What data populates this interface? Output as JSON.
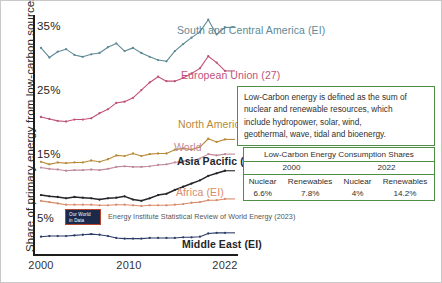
{
  "axes": {
    "ylabel": "Share of primary energy from low-carbon sources",
    "yticks": [
      "35%",
      "25%",
      "15%",
      "5%"
    ],
    "xticks": [
      "2000",
      "2010",
      "2022"
    ]
  },
  "series_labels": {
    "south_central_america": "South and Central America (EI)",
    "european_union": "European Union (27)",
    "north_america": "North America (EI)",
    "world": "World",
    "asia_pacific": "Asia Pacific (EI)",
    "africa": "Africa (EI)",
    "middle_east": "Middle East (EI)"
  },
  "note": {
    "line1": "Low-Carbon energy is defined as the sum of",
    "line2": "nuclear and renewable resources, which",
    "line3": "include hydropower, solar, wind,",
    "line4": "geothermal, wave, tidal and bioenergy."
  },
  "table": {
    "title": "Low-Carbon Energy Consumption Shares",
    "year_2000": "2000",
    "year_2022": "2022",
    "h_nuclear_2000": "Nuclear",
    "h_renew_2000": "Renewables",
    "h_nuclear_2022": "Nuclear",
    "h_renew_2022": "Renewables",
    "v_nuclear_2000": "6.6%",
    "v_renew_2000": "7.8%",
    "v_nuclear_2022": "4%",
    "v_renew_2022": "14.2%"
  },
  "footer": {
    "logo_line1": "Our World",
    "logo_line2": "in Data",
    "source": "Energy Institute Statistical Review of World Energy (2023)"
  },
  "colors": {
    "south_central_america": "#5d8a96",
    "european_union": "#c0527a",
    "north_america": "#b98a36",
    "world": "#c08a9a",
    "asia_pacific": "#25262a",
    "africa": "#d98a6a",
    "middle_east": "#2c3d68",
    "note_border": "#4f8f45",
    "axis": "#1d1d1d"
  },
  "chart_data": {
    "type": "line",
    "title": "",
    "xlabel": "",
    "ylabel": "Share of primary energy from low-carbon sources",
    "xlim": [
      2000,
      2022
    ],
    "ylim": [
      0,
      38
    ],
    "grid": false,
    "legend_position": "inline-right",
    "x": [
      2000,
      2001,
      2002,
      2003,
      2004,
      2005,
      2006,
      2007,
      2008,
      2009,
      2010,
      2011,
      2012,
      2013,
      2014,
      2015,
      2016,
      2017,
      2018,
      2019,
      2020,
      2021,
      2022
    ],
    "series": [
      {
        "name": "South and Central America (EI)",
        "color": "#5d8a96",
        "values": [
          30.8,
          29.3,
          30.2,
          30.6,
          29.7,
          29.4,
          29.8,
          30.0,
          30.9,
          31.5,
          30.3,
          30.8,
          30.0,
          29.4,
          28.9,
          28.7,
          30.3,
          31.4,
          32.4,
          33.3,
          35.2,
          32.9,
          34.0
        ]
      },
      {
        "name": "European Union (27)",
        "color": "#c0527a",
        "values": [
          20.0,
          19.7,
          19.4,
          19.3,
          19.6,
          19.6,
          19.8,
          20.6,
          21.2,
          22.2,
          22.4,
          23.0,
          24.2,
          25.4,
          26.3,
          25.6,
          25.6,
          26.1,
          26.8,
          27.6,
          29.5,
          28.5,
          27.2
        ]
      },
      {
        "name": "North America (EI)",
        "color": "#b98a36",
        "values": [
          13.0,
          12.6,
          12.9,
          12.8,
          12.9,
          12.9,
          13.2,
          13.0,
          13.4,
          14.0,
          13.9,
          14.3,
          13.9,
          14.2,
          14.3,
          14.3,
          14.9,
          15.1,
          14.9,
          15.3,
          16.6,
          16.1,
          16.5
        ]
      },
      {
        "name": "World",
        "color": "#c08a9a",
        "values": [
          12.1,
          11.9,
          11.8,
          11.6,
          11.7,
          11.7,
          11.8,
          11.7,
          11.9,
          12.2,
          12.3,
          12.2,
          12.2,
          12.3,
          12.5,
          12.6,
          12.9,
          13.1,
          13.2,
          13.5,
          14.2,
          14.0,
          14.2
        ]
      },
      {
        "name": "Asia Pacific (EI)",
        "color": "#25262a",
        "values": [
          7.8,
          7.6,
          7.5,
          7.3,
          7.5,
          7.4,
          7.3,
          7.1,
          7.3,
          7.4,
          7.6,
          7.1,
          6.9,
          7.3,
          7.8,
          8.0,
          8.6,
          9.1,
          9.6,
          10.1,
          10.8,
          11.2,
          11.6
        ]
      },
      {
        "name": "Africa (EI)",
        "color": "#d98a6a",
        "values": [
          6.9,
          6.7,
          6.5,
          6.3,
          6.3,
          6.3,
          6.3,
          6.2,
          6.2,
          6.3,
          6.3,
          6.2,
          6.1,
          6.2,
          6.2,
          6.2,
          6.3,
          6.4,
          6.6,
          6.7,
          7.0,
          7.0,
          7.2
        ]
      },
      {
        "name": "Middle East (EI)",
        "color": "#2c3d68",
        "values": [
          1.3,
          1.4,
          1.4,
          1.4,
          1.5,
          1.6,
          1.7,
          1.6,
          1.4,
          1.1,
          1.0,
          1.0,
          1.0,
          1.1,
          1.1,
          1.1,
          1.1,
          1.2,
          1.2,
          1.3,
          1.8,
          1.9,
          1.9
        ]
      }
    ]
  }
}
